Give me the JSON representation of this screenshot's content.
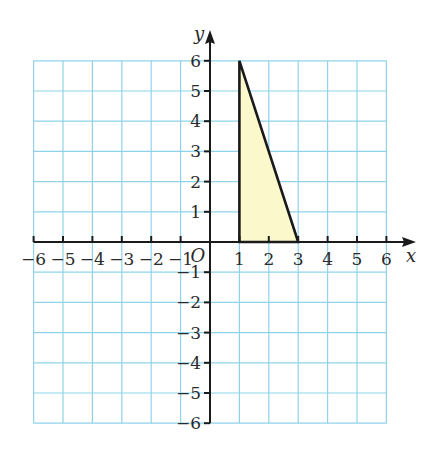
{
  "figure": {
    "x_axis_label": "x",
    "y_axis_label": "y",
    "origin_label": "O",
    "x_ticks": [
      "−6",
      "−5",
      "−4",
      "−3",
      "−2",
      "−1",
      "1",
      "2",
      "3",
      "4",
      "5",
      "6"
    ],
    "y_ticks": [
      "6",
      "5",
      "4",
      "3",
      "2",
      "1",
      "−1",
      "−2",
      "−3",
      "−4",
      "−5",
      "−6"
    ],
    "x_range": [
      -6,
      6
    ],
    "y_range": [
      -6,
      6
    ],
    "grid_color": "#8fd3ea",
    "axis_color": "#1a1a1a",
    "shape": {
      "type": "triangle",
      "vertices": [
        [
          1,
          0
        ],
        [
          1,
          6
        ],
        [
          3,
          0
        ]
      ],
      "fill": "#fbf8cc",
      "stroke": "#1a1a1a"
    }
  }
}
